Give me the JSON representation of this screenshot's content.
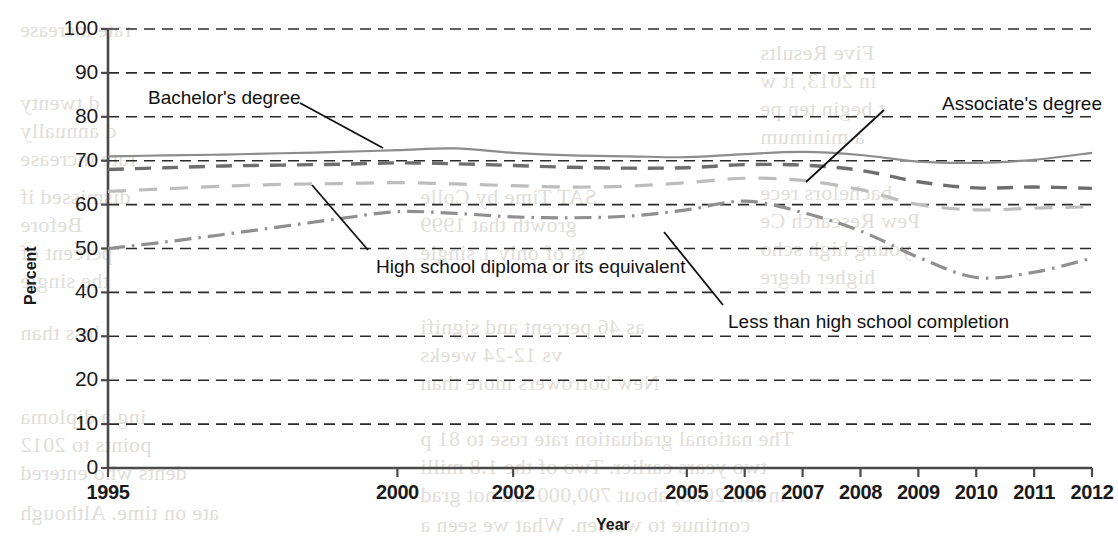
{
  "chart_data": {
    "type": "line",
    "title": "",
    "xlabel": "Year",
    "ylabel": "Percent",
    "xlim": [
      1995,
      2012
    ],
    "ylim": [
      0,
      100
    ],
    "grid": true,
    "grid_style": "dashed horizontal",
    "legend_position": "inline annotations",
    "x": [
      1995,
      1996,
      1997,
      1998,
      1999,
      2000,
      2001,
      2002,
      2003,
      2004,
      2005,
      2006,
      2007,
      2008,
      2009,
      2010,
      2011,
      2012
    ],
    "xticks": [
      "1995",
      "2000",
      "2002",
      "2005",
      "2006",
      "2007",
      "2008",
      "2009",
      "2010",
      "2011",
      "2012"
    ],
    "xtick_values": [
      1995,
      2000,
      2002,
      2005,
      2006,
      2007,
      2008,
      2009,
      2010,
      2011,
      2012
    ],
    "yticks": [
      "0",
      "10",
      "20",
      "30",
      "40",
      "50",
      "60",
      "70",
      "80",
      "90",
      "100"
    ],
    "ytick_values": [
      0,
      10,
      20,
      30,
      40,
      50,
      60,
      70,
      80,
      90,
      100
    ],
    "series": [
      {
        "name": "Bachelor's degree",
        "style": "solid",
        "color": "#8c8c8c",
        "values": [
          71.0,
          71.2,
          71.4,
          71.7,
          72.0,
          72.4,
          72.8,
          71.8,
          71.2,
          71.0,
          70.8,
          71.5,
          72.0,
          71.3,
          69.8,
          69.5,
          70.2,
          71.8
        ]
      },
      {
        "name": "Associate's degree",
        "style": "dashed",
        "color": "#6e6e6e",
        "values": [
          68.0,
          68.4,
          68.8,
          69.0,
          69.2,
          69.5,
          69.3,
          68.9,
          68.5,
          68.3,
          68.4,
          69.1,
          69.0,
          67.8,
          65.2,
          63.8,
          64.0,
          63.7
        ]
      },
      {
        "name": "High school diploma or its equivalent",
        "style": "dashed-light",
        "color": "#bdbdbd",
        "values": [
          63.0,
          63.6,
          64.2,
          64.6,
          64.8,
          65.0,
          64.7,
          64.3,
          64.0,
          64.2,
          65.0,
          66.0,
          65.5,
          63.4,
          60.0,
          58.8,
          59.2,
          59.5
        ]
      },
      {
        "name": "Less than high school completion",
        "style": "dash-dot",
        "color": "#8f8f8f",
        "values": [
          50.0,
          51.5,
          53.2,
          55.0,
          56.8,
          58.4,
          58.0,
          57.2,
          57.0,
          57.4,
          58.8,
          60.8,
          58.2,
          54.0,
          48.0,
          43.4,
          44.6,
          47.8
        ]
      }
    ],
    "annotations": [
      {
        "name": "bachelors-degree",
        "text": "Bachelor's degree",
        "label_x": 148,
        "label_y": 87,
        "leader": [
          [
            300,
            103
          ],
          [
            383,
            148
          ]
        ]
      },
      {
        "name": "associates-degree",
        "text": "Associate's degree",
        "label_x": 887,
        "label_y": 93,
        "leader": [
          [
            884,
            110
          ],
          [
            806,
            182
          ]
        ]
      },
      {
        "name": "high-school-diploma",
        "text": "High school diploma or its equivalent",
        "label_x": 376,
        "label_y": 256,
        "leader": [
          [
            368,
            250
          ],
          [
            312,
            185
          ]
        ]
      },
      {
        "name": "less-than-high-school",
        "text": "Less than high school completion",
        "label_x": 728,
        "label_y": 311,
        "leader": [
          [
            723,
            305
          ],
          [
            664,
            232
          ]
        ]
      }
    ]
  },
  "ghost_text": [
    {
      "text": "Five Results",
      "x": 760,
      "y": 40,
      "size": 22
    },
    {
      "text": "in 2013, it w",
      "x": 760,
      "y": 68,
      "size": 22
    },
    {
      "text": "t begin ten pe",
      "x": 760,
      "y": 96,
      "size": 22
    },
    {
      "text": "a minimum",
      "x": 760,
      "y": 124,
      "size": 22
    },
    {
      "text": "bachelors rece",
      "x": 760,
      "y": 180,
      "size": 22
    },
    {
      "text": "Pew Research Ce",
      "x": 760,
      "y": 208,
      "size": 22
    },
    {
      "text": "young high scho",
      "x": 760,
      "y": 236,
      "size": 22
    },
    {
      "text": "higher degre",
      "x": 760,
      "y": 264,
      "size": 22
    },
    {
      "text": "rate increase",
      "x": 20,
      "y": 18,
      "size": 21
    },
    {
      "text": "d twenty",
      "x": 20,
      "y": 90,
      "size": 22
    },
    {
      "text": "d annually",
      "x": 20,
      "y": 118,
      "size": 22
    },
    {
      "text": "rate increase",
      "x": 20,
      "y": 146,
      "size": 22
    },
    {
      "text": "dismissed if",
      "x": 20,
      "y": 184,
      "size": 22
    },
    {
      "text": "Before",
      "x": 20,
      "y": 212,
      "size": 22
    },
    {
      "text": "percent of",
      "x": 20,
      "y": 240,
      "size": 22
    },
    {
      "text": "the single",
      "x": 20,
      "y": 268,
      "size": 22
    },
    {
      "text": "less than",
      "x": 20,
      "y": 320,
      "size": 22
    },
    {
      "text": "ing a diploma",
      "x": 20,
      "y": 404,
      "size": 22
    },
    {
      "text": "points to 2012",
      "x": 20,
      "y": 432,
      "size": 22
    },
    {
      "text": "dents who entered",
      "x": 20,
      "y": 460,
      "size": 22
    },
    {
      "text": "ate on time. Although",
      "x": 20,
      "y": 500,
      "size": 22
    },
    {
      "text": "SAT Time by Colle",
      "x": 420,
      "y": 184,
      "size": 22
    },
    {
      "text": "growth that 1999",
      "x": 420,
      "y": 212,
      "size": 22
    },
    {
      "text": "st of only 1 single",
      "x": 420,
      "y": 240,
      "size": 22
    },
    {
      "text": "as 46 percent and signifi",
      "x": 420,
      "y": 314,
      "size": 22
    },
    {
      "text": "vs 12-24 weeks",
      "x": 420,
      "y": 342,
      "size": 22
    },
    {
      "text": "New borrowers more than",
      "x": 420,
      "y": 370,
      "size": 22
    },
    {
      "text": "The national graduation rate rose to 81 p",
      "x": 420,
      "y": 426,
      "size": 22
    },
    {
      "text": "two years earlier. Two of the 1.8 milli",
      "x": 420,
      "y": 454,
      "size": 22
    },
    {
      "text": "in fall 2005, about 700,000 did not grad",
      "x": 420,
      "y": 482,
      "size": 22
    },
    {
      "text": "continue to worsen. What we seen a",
      "x": 420,
      "y": 512,
      "size": 22
    }
  ]
}
